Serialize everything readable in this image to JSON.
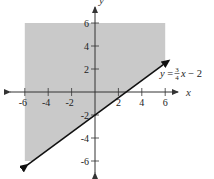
{
  "chart_data": {
    "type": "line",
    "title": "",
    "xlabel": "x",
    "ylabel": "y",
    "xlim": [
      -6,
      6
    ],
    "ylim": [
      -6,
      6
    ],
    "grid": false,
    "x_ticks": [
      -6,
      -4,
      -2,
      2,
      4,
      6
    ],
    "y_ticks": [
      6,
      4,
      2,
      -2,
      -4,
      -6
    ],
    "x_tick_labels": [
      "-6",
      "-4",
      "-2",
      "2",
      "4",
      "6"
    ],
    "y_tick_labels": [
      "6",
      "4",
      "2",
      "-2",
      "-4",
      "-6"
    ],
    "series": [
      {
        "name": "y = 3/4 x - 2",
        "equation": {
          "slope": 0.75,
          "intercept": -2
        },
        "style": "solid boundary line with arrows at both ends",
        "x": [
          -5.8,
          6.3
        ],
        "values": [
          -6.35,
          2.725
        ]
      }
    ],
    "shaded_region": {
      "description": "region above the line y = 3/4 x - 2 (y >= 3/4 x - 2), clipped to the plot window",
      "inequality": "y >= 3/4 x - 2",
      "polygon": [
        [
          -6,
          6
        ],
        [
          6,
          6
        ],
        [
          6,
          2.5
        ],
        [
          -5.3333,
          -6
        ],
        [
          -6,
          -6
        ]
      ],
      "color": "#c9c9c9"
    },
    "annotations": [
      {
        "text": "y = 3/4 x - 2",
        "x": 6.2,
        "y": 1.6
      }
    ]
  },
  "labels": {
    "x_axis": "x",
    "y_axis": "y",
    "equation_lhs": "y = ",
    "equation_num": "3",
    "equation_den": "4",
    "equation_rhs": "x − 2"
  },
  "colors": {
    "shade": "#c9c9c9",
    "line": "#111111",
    "axis": "#333333",
    "background": "#ffffff"
  },
  "layout": {
    "origin_px": [
      95,
      92
    ],
    "scale_x": 11.7,
    "scale_y": 11.5
  }
}
